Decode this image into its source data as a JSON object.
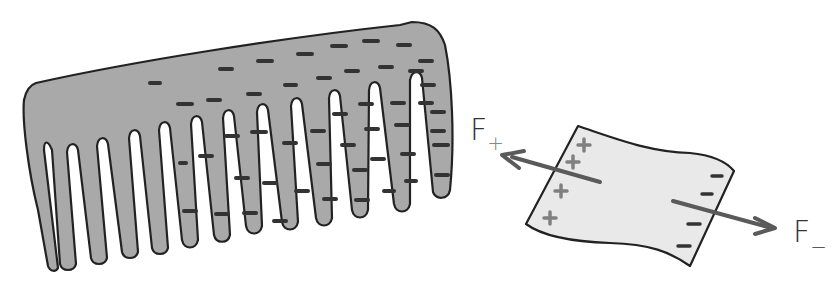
{
  "diagram": {
    "colors": {
      "comb_fill": "#a9a9a9",
      "paper_fill": "#e9e9e9",
      "outline": "#222222",
      "charge_minus": "#333333",
      "charge_plus": "#808080",
      "arrow": "#5a5a5a"
    },
    "comb": {
      "charge_sign": "-",
      "teeth_count": 15
    },
    "paper": {
      "left_side_charges": [
        "+",
        "+",
        "+",
        "+"
      ],
      "right_side_charges": [
        "-",
        "-",
        "-",
        "-"
      ]
    },
    "forces": {
      "f_plus": {
        "symbol": "F",
        "subscript": "+",
        "direction": "toward comb (left)"
      },
      "f_minus": {
        "symbol": "F",
        "subscript": "−",
        "direction": "away from comb (right)"
      }
    }
  }
}
